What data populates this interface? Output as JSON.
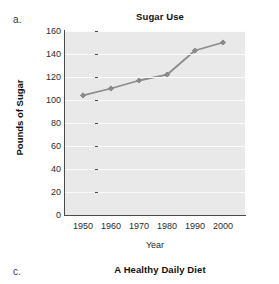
{
  "panels": {
    "a": {
      "letter": "a."
    },
    "c": {
      "letter": "c.",
      "title": "A Healthy Daily Diet"
    }
  },
  "chart_data": {
    "type": "line",
    "title": "Sugar Use",
    "xlabel": "Year",
    "ylabel": "Pounds of Sugar",
    "categories": [
      "1950",
      "1960",
      "1970",
      "1980",
      "1990",
      "2000"
    ],
    "x": [
      1950,
      1960,
      1970,
      1980,
      1990,
      2000
    ],
    "values": [
      104,
      110,
      117,
      122,
      143,
      150
    ],
    "series": [
      {
        "name": "Sugar Use",
        "values": [
          104,
          110,
          117,
          122,
          143,
          150
        ],
        "color": "#8c8c8c",
        "marker": "diamond"
      }
    ],
    "ylim": [
      0,
      160
    ],
    "yticks": [
      0,
      20,
      40,
      60,
      80,
      100,
      120,
      140,
      160
    ],
    "ytick_labels": [
      "0",
      "20",
      "40",
      "60",
      "80",
      "100",
      "120",
      "140",
      "160"
    ],
    "xticks": [
      1950,
      1960,
      1970,
      1980,
      1990,
      2000
    ],
    "xtick_labels": [
      "1950",
      "1960",
      "1970",
      "1980",
      "1990",
      "2000"
    ],
    "grid": "horizontal",
    "legend": "none",
    "plot_background": "#e9e9e9",
    "gridline_color": "#fbfbfb",
    "axis_color": "#4a4a4a"
  }
}
